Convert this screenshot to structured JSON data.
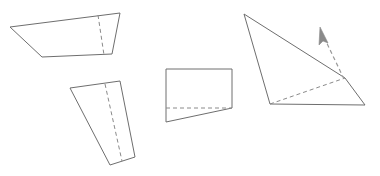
{
  "canvas": {
    "width": 380,
    "height": 176,
    "background_color": "#ffffff",
    "stroke_color": "#6e6e6e",
    "dashed_stroke_color": "#8a8a8a",
    "arrow_color": "#9a9a9a"
  },
  "diagram": {
    "shape_count": 4,
    "shapes": [
      {
        "id": "shape-1",
        "name": "trapezoid-top-left",
        "outline_points": "10,27 120,13 112,54 42,57",
        "dashed_lines": [
          {
            "name": "fold-line",
            "points": "98,15 104,55"
          }
        ]
      },
      {
        "id": "shape-2",
        "name": "slanted-parallelogram-lower-left",
        "outline_points": "70,88 120,81 135,157 110,165",
        "dashed_lines": [
          {
            "name": "fold-line",
            "points": "105,84 122,161"
          }
        ]
      },
      {
        "id": "shape-3",
        "name": "rectangle-with-wedge-center",
        "outline_points": "166,69 232,69 232,108 166,122",
        "dashed_lines": [
          {
            "name": "fold-line",
            "points": "166,108 232,108"
          }
        ]
      },
      {
        "id": "shape-4",
        "name": "quadrilateral-right-with-cursor",
        "outline_points": "244,14 345,78 365,105 270,104",
        "dashed_lines": [
          {
            "name": "fold-line",
            "points": "270,104 345,78"
          }
        ],
        "arrow": {
          "name": "direction-arrow",
          "shaft_points": "344,79 322,33",
          "head_points": "320,27 328,43 323,41 319,45",
          "direction": "up-left"
        }
      }
    ]
  }
}
